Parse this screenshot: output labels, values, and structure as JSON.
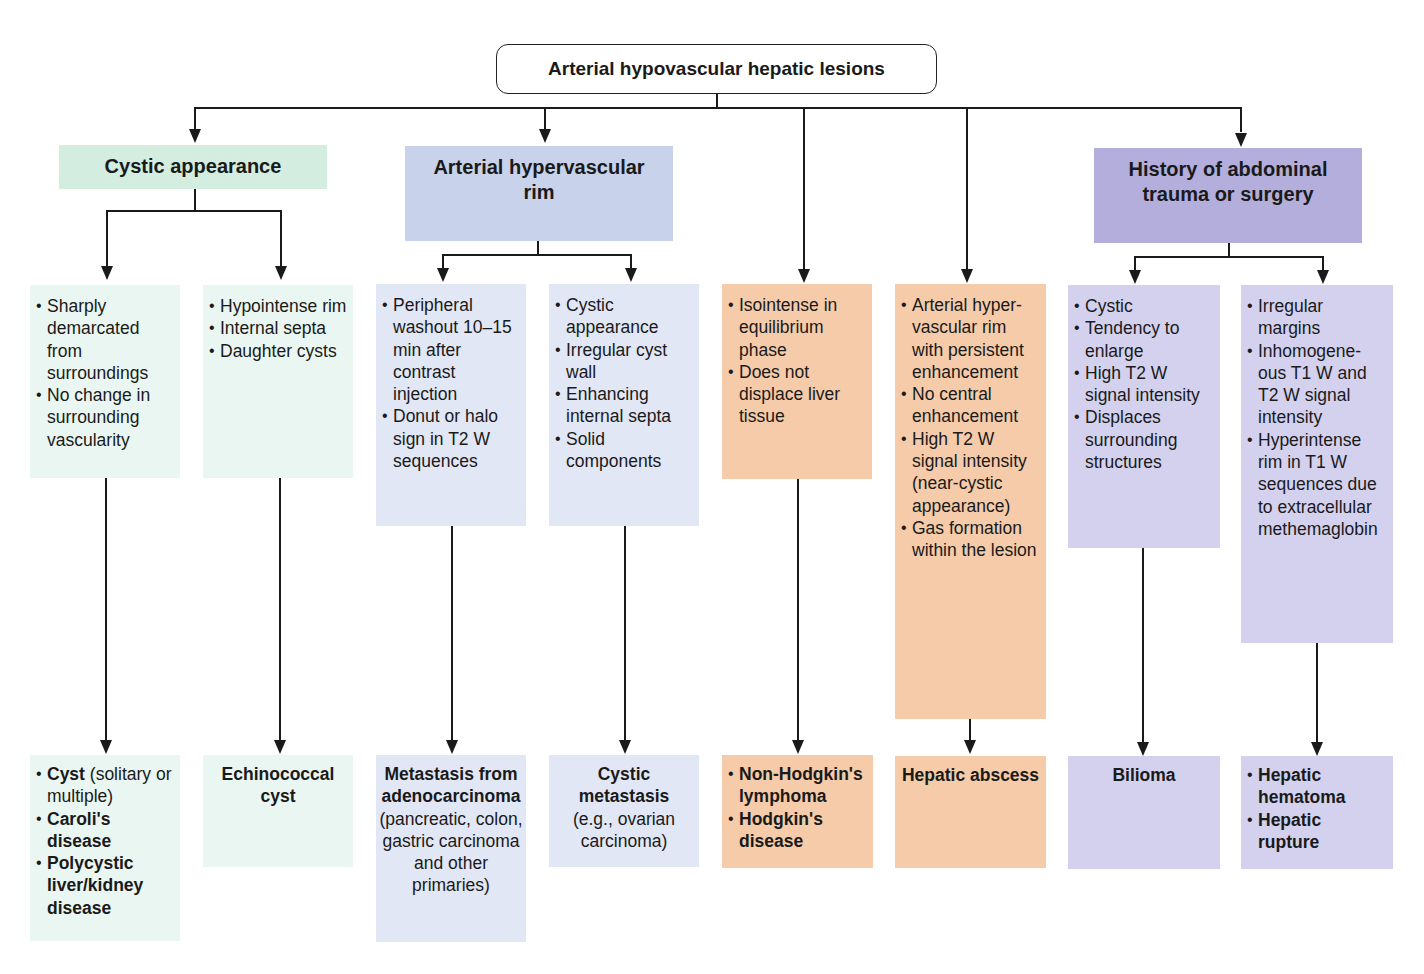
{
  "root": {
    "title": "Arterial hypovascular hepatic lesions"
  },
  "categories": [
    {
      "title": "Cystic appearance",
      "color": "#d3ede1"
    },
    {
      "title": "Arterial hypervascular rim",
      "color": "#c8d2ea"
    },
    {
      "title": "History of abdominal trauma or surgery",
      "color": "#b3aedb"
    }
  ],
  "features": [
    {
      "items": [
        "Sharply demarcated from surroundings",
        "No change in surrounding vascularity"
      ],
      "color": "#eaf6f1"
    },
    {
      "items": [
        "Hypointense rim",
        "Internal septa",
        "Daughter cysts"
      ],
      "color": "#eaf6f1"
    },
    {
      "items": [
        "Peripheral washout 10–15 min after contrast injection",
        "Donut or halo sign in T2 W sequences"
      ],
      "color": "#e2e7f6"
    },
    {
      "items": [
        "Cystic appearance",
        "Irregular cyst wall",
        "Enhancing internal septa",
        "Solid components"
      ],
      "color": "#e2e7f6"
    },
    {
      "items": [
        "Isointense in equilibrium phase",
        "Does not displace liver tissue"
      ],
      "color": "#f5cba9"
    },
    {
      "items": [
        "Arterial hyper-vascular rim with persistent enhancement",
        "No central enhancement",
        "High T2 W signal intensity (near-cystic appearance)",
        "Gas formation within the lesion"
      ],
      "color": "#f5cba9"
    },
    {
      "items": [
        "Cystic",
        "Tendency to enlarge",
        "High T2 W signal intensity",
        "Displaces surrounding structures"
      ],
      "color": "#d3d1ee"
    },
    {
      "items": [
        "Irregular margins",
        "Inhomogene-ous T1 W and T2 W signal intensity",
        "Hyperintense rim in T1 W sequences due to extracellular methemaglobin"
      ],
      "color": "#d3d1ee"
    }
  ],
  "diagnoses": [
    {
      "items": [
        {
          "bold": "Cyst",
          "normal": " (solitary or multiple)"
        },
        {
          "bold": "Caroli's disease",
          "normal": ""
        },
        {
          "bold": "Polycystic liver/kidney disease",
          "normal": ""
        }
      ]
    },
    {
      "title": "Echinococcal cyst",
      "subtitle": ""
    },
    {
      "title": "Metastasis from adenocarcinoma",
      "subtitle": "(pancreatic, colon, gastric carcinoma and other primaries)"
    },
    {
      "title": "Cystic metastasis",
      "subtitle": "(e.g., ovarian carcinoma)"
    },
    {
      "items": [
        {
          "bold": "Non-Hodgkin's lymphoma",
          "normal": ""
        },
        {
          "bold": "Hodgkin's disease",
          "normal": ""
        }
      ]
    },
    {
      "title": "Hepatic abscess",
      "subtitle": ""
    },
    {
      "title": "Bilioma",
      "subtitle": ""
    },
    {
      "items": [
        {
          "bold": "Hepatic hematoma",
          "normal": ""
        },
        {
          "bold": "Hepatic rupture",
          "normal": ""
        }
      ]
    }
  ]
}
